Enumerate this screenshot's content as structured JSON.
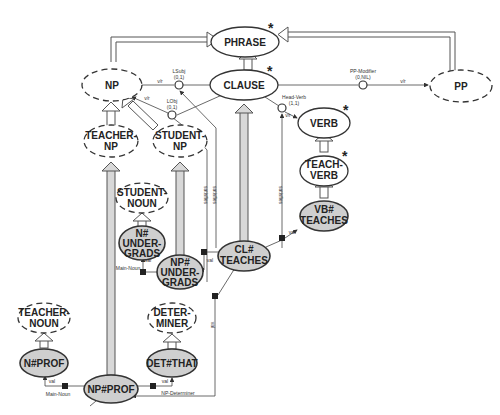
{
  "diagram": {
    "nodes": {
      "phrase": {
        "label": "PHRASE",
        "style": "solid",
        "starred": true
      },
      "np": {
        "label": "NP",
        "style": "dashed"
      },
      "clause": {
        "label": "CLAUSE",
        "style": "solid",
        "starred": true
      },
      "pp": {
        "label": "PP",
        "style": "dashed"
      },
      "teacher_np": {
        "line1": "TEACHER-",
        "line2": "NP",
        "style": "dashed"
      },
      "student_np": {
        "line1": "STUDENT-",
        "line2": "NP",
        "style": "dashed"
      },
      "verb": {
        "label": "VERB",
        "style": "solid",
        "starred": true
      },
      "teach_verb": {
        "line1": "TEACH-",
        "line2": "VERB",
        "style": "solid",
        "starred": true
      },
      "vb_teaches": {
        "line1": "VB#",
        "line2": "TEACHES",
        "style": "shaded"
      },
      "student_noun": {
        "line1": "STUDENT-",
        "line2": "NOUN",
        "style": "dashed"
      },
      "n_undergrads": {
        "line1": "N#",
        "line2": "UNDER-",
        "line3": "GRADS",
        "style": "shaded"
      },
      "np_undergrads": {
        "line1": "NP#",
        "line2": "UNDER-",
        "line3": "GRADS",
        "style": "shaded"
      },
      "cl_teaches": {
        "line1": "CL#",
        "line2": "TEACHES",
        "style": "shaded"
      },
      "teacher_noun": {
        "line1": "TEACHER-",
        "line2": "NOUN",
        "style": "dashed"
      },
      "determiner": {
        "line1": "DETER-",
        "line2": "MINER",
        "style": "dashed"
      },
      "n_prof": {
        "label": "N#PROF",
        "style": "shaded"
      },
      "det_that": {
        "label": "DET#THAT",
        "style": "shaded"
      },
      "np_prof": {
        "label": "NP#PROF",
        "style": "shaded"
      }
    },
    "roles": {
      "lsubj": {
        "name": "LSubj",
        "card": "(0,1)"
      },
      "lobj": {
        "name": "LObj",
        "card": "(0,1)"
      },
      "pp_modifier": {
        "name": "PP-Modifier",
        "card": "(0,NIL)"
      },
      "head_verb": {
        "name": "Head-Verb",
        "card": "(1,1)"
      }
    },
    "edge_labels": {
      "v_r": "v/r",
      "main_noun": "Main-Noun",
      "np_determiner": "NP-Determiner",
      "val": "val",
      "satisfies": "satisfies",
      "star": "*"
    }
  }
}
